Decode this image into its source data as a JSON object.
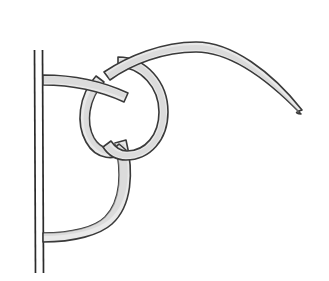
{
  "figure": {
    "style": "line-art-illustration",
    "background_color": "#ffffff",
    "canvas": {
      "width": 329,
      "height": 281
    }
  },
  "colors": {
    "background": "#ffffff",
    "rope_fill": "#e9e9e9",
    "rope_shade": "#cfcfcf",
    "rope_outline": "#3a3a3a",
    "pole_stroke": "#2b2b2b"
  },
  "pole": {
    "name": "vertical-pole",
    "orientation": "vertical",
    "left_edge_x": 34,
    "right_edge_x": 43,
    "top_y": 50,
    "bottom_y": 273,
    "stroke_width": 1.7,
    "rendered_as": "two parallel thin lines"
  },
  "rope": {
    "name": "rope-strand",
    "thickness_px": 11,
    "fill": "#e9e9e9",
    "outline": "#3a3a3a",
    "segments": [
      {
        "id": "upper-tail-to-pole",
        "label": "Upper strand running left from the knot to the pole",
        "start": [
          43,
          80
        ],
        "end": [
          120,
          72
        ],
        "description": "Terminates flush against the pole's right edge at upper left"
      },
      {
        "id": "upper-arc-right",
        "label": "Long working end arcing up and over to the right",
        "start": [
          120,
          60
        ],
        "peak": [
          196,
          44
        ],
        "end": [
          302,
          112
        ],
        "description": "Rises to a crest near x=196 then descends to a tapered point at the far right"
      },
      {
        "id": "right-loop",
        "label": "Large loop on the right side of the knot",
        "center": [
          118,
          110
        ],
        "radius_x": 48,
        "radius_y": 52
      },
      {
        "id": "inner-small-loop",
        "label": "Small inner loop passing under the right loop",
        "center": [
          101,
          122
        ],
        "radius_x": 20,
        "radius_y": 32
      },
      {
        "id": "lower-bight",
        "label": "Lower bight sweeping down and back to the pole",
        "start": [
          123,
          152
        ],
        "low_point": [
          98,
          232
        ],
        "end": [
          43,
          238
        ],
        "description": "Terminates flush against the pole's right edge at lower left"
      }
    ],
    "crossings": [
      {
        "id": "crossing-top",
        "at": [
          126,
          66
        ],
        "over": "upper-arc-right",
        "under": "right-loop"
      },
      {
        "id": "crossing-upper-left",
        "at": [
          96,
          86
        ],
        "over": "right-loop",
        "under": "upper-tail-to-pole"
      },
      {
        "id": "crossing-mid-left",
        "at": [
          88,
          104
        ],
        "over": "inner-small-loop",
        "under": "upper-tail-to-pole"
      },
      {
        "id": "crossing-lower",
        "at": [
          116,
          150
        ],
        "over": "lower-bight",
        "under": "inner-small-loop"
      }
    ]
  },
  "endpoints": [
    {
      "id": "rope-tip-right",
      "label": "Tapered free end of rope",
      "position": [
        302,
        112
      ]
    },
    {
      "id": "rope-end-pole-top",
      "label": "Rope end at pole, upper",
      "position": [
        43,
        80
      ]
    },
    {
      "id": "rope-end-pole-bottom",
      "label": "Rope end at pole, lower",
      "position": [
        43,
        238
      ]
    },
    {
      "id": "pole-top",
      "label": "Top of pole",
      "position": [
        38,
        50
      ]
    },
    {
      "id": "pole-bottom",
      "label": "Bottom of pole",
      "position": [
        38,
        273
      ]
    }
  ],
  "annotations": {
    "text_labels": [],
    "caption": ""
  }
}
